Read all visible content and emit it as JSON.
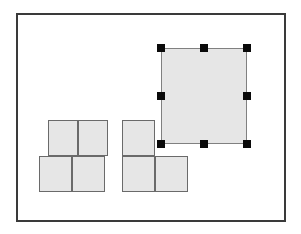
{
  "canvas": {
    "width": 301,
    "height": 234,
    "background_color": "#ffffff",
    "label": "drawing-canvas"
  },
  "artboard": {
    "label": "Artboard",
    "x": 16,
    "y": 13,
    "width": 270,
    "height": 209,
    "border_width": 2,
    "border_color": "#3a3a3a",
    "fill_color": "#ffffff"
  },
  "style": {
    "shape_fill": "#e6e6e6",
    "shape_stroke": "#6a6a6a",
    "shape_stroke_width": 1,
    "selected_stroke": "#808080",
    "selected_stroke_width": 1,
    "handle_color": "#0a0a0a",
    "handle_size": 8
  },
  "groups": [
    {
      "name": "left-stack",
      "label": "Left block group",
      "selected": false,
      "shapes": [
        {
          "name": "left-top-a",
          "label": "Square A",
          "x": 48,
          "y": 120,
          "width": 30,
          "height": 36
        },
        {
          "name": "left-top-b",
          "label": "Square B",
          "x": 78,
          "y": 120,
          "width": 30,
          "height": 36
        },
        {
          "name": "left-bottom-a",
          "label": "Square C",
          "x": 39,
          "y": 156,
          "width": 33,
          "height": 36
        },
        {
          "name": "left-bottom-b",
          "label": "Square D",
          "x": 72,
          "y": 156,
          "width": 33,
          "height": 36
        }
      ]
    },
    {
      "name": "middle-stack",
      "label": "Middle block group",
      "selected": false,
      "shapes": [
        {
          "name": "middle-top-a",
          "label": "Square E",
          "x": 122,
          "y": 120,
          "width": 33,
          "height": 36
        },
        {
          "name": "middle-bottom-a",
          "label": "Square F",
          "x": 122,
          "y": 156,
          "width": 33,
          "height": 36
        },
        {
          "name": "middle-bottom-b",
          "label": "Square G",
          "x": 155,
          "y": 156,
          "width": 33,
          "height": 36
        }
      ]
    },
    {
      "name": "selected-rectangle-group",
      "label": "Selected rectangle",
      "selected": true,
      "shapes": [
        {
          "name": "selected-rectangle",
          "label": "Rectangle",
          "x": 161,
          "y": 48,
          "width": 86,
          "height": 96
        }
      ]
    }
  ],
  "selection": {
    "name": "selection-handles",
    "label": "Resize handles",
    "target": "selected-rectangle",
    "count": 8,
    "handles": [
      {
        "name": "handle-nw",
        "position": "top-left",
        "x": 157,
        "y": 44
      },
      {
        "name": "handle-n",
        "position": "top-center",
        "x": 200,
        "y": 44
      },
      {
        "name": "handle-ne",
        "position": "top-right",
        "x": 243,
        "y": 44
      },
      {
        "name": "handle-w",
        "position": "middle-left",
        "x": 157,
        "y": 92
      },
      {
        "name": "handle-e",
        "position": "middle-right",
        "x": 243,
        "y": 92
      },
      {
        "name": "handle-sw",
        "position": "bottom-left",
        "x": 157,
        "y": 140
      },
      {
        "name": "handle-s",
        "position": "bottom-center",
        "x": 200,
        "y": 140
      },
      {
        "name": "handle-se",
        "position": "bottom-right",
        "x": 243,
        "y": 140
      }
    ]
  }
}
